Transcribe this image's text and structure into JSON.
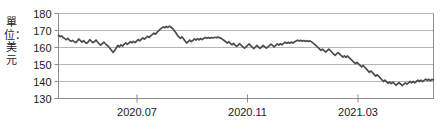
{
  "chart_data": {
    "type": "line",
    "title": "",
    "subtitle": "",
    "xlabel": "",
    "ylabel": "單位：美元",
    "ylabel_note": "Unit: US dollars",
    "ylim": [
      130,
      180
    ],
    "yticks": [
      130,
      140,
      150,
      160,
      170,
      180
    ],
    "ytick_labels": [
      "130",
      "140",
      "150",
      "160",
      "170",
      "180"
    ],
    "xticks": [
      "2020.07",
      "2020.11",
      "2021.03"
    ],
    "xtick_labels": [
      "2020.07",
      "2020.11",
      "2021.03"
    ],
    "grid": true,
    "legend": "none",
    "series": [
      {
        "name": "price",
        "color": "#4d4d4d",
        "values": [
          167.2,
          166.4,
          166.8,
          165.9,
          165.2,
          164.6,
          165.4,
          164.3,
          163.6,
          164.2,
          163.4,
          162.9,
          163.8,
          165.0,
          164.1,
          163.2,
          164.0,
          163.1,
          162.4,
          163.3,
          164.6,
          163.7,
          162.8,
          163.5,
          164.4,
          163.2,
          162.1,
          161.4,
          162.3,
          163.1,
          162.2,
          161.3,
          160.6,
          159.4,
          158.2,
          157.1,
          158.4,
          159.8,
          161.2,
          160.4,
          161.6,
          160.8,
          161.9,
          162.8,
          161.8,
          162.6,
          163.5,
          162.7,
          163.6,
          162.9,
          163.8,
          164.7,
          163.9,
          164.8,
          165.6,
          164.9,
          165.8,
          166.6,
          165.9,
          166.8,
          167.6,
          168.4,
          167.8,
          168.9,
          169.8,
          170.6,
          171.4,
          172.1,
          171.6,
          172.4,
          171.8,
          172.6,
          171.9,
          171.2,
          170.1,
          168.8,
          167.4,
          166.2,
          165.4,
          166.3,
          165.1,
          163.8,
          162.6,
          163.5,
          164.4,
          163.4,
          164.2,
          165.1,
          164.3,
          165.2,
          164.5,
          165.3,
          164.6,
          165.4,
          165.9,
          165.4,
          165.8,
          165.5,
          165.9,
          165.6,
          166.0,
          165.7,
          166.1,
          165.8,
          165.4,
          164.8,
          164.1,
          163.4,
          162.6,
          163.4,
          162.4,
          161.6,
          162.4,
          161.4,
          160.6,
          161.4,
          162.2,
          161.2,
          160.4,
          159.6,
          160.4,
          161.3,
          162.1,
          161.1,
          160.2,
          159.4,
          160.3,
          161.2,
          160.3,
          159.5,
          160.4,
          161.2,
          160.4,
          159.6,
          160.4,
          161.1,
          162.0,
          161.2,
          160.4,
          161.2,
          162.1,
          161.4,
          162.2,
          161.6,
          162.4,
          163.1,
          162.4,
          163.1,
          162.5,
          163.2,
          162.6,
          163.3,
          163.8,
          164.3,
          163.8,
          164.2,
          163.7,
          164.1,
          163.6,
          164.0,
          163.5,
          163.9,
          163.3,
          162.6,
          161.8,
          160.9,
          160.1,
          159.2,
          158.3,
          159.1,
          158.2,
          157.3,
          158.1,
          159.0,
          158.1,
          157.2,
          156.3,
          155.4,
          156.2,
          157.0,
          156.1,
          155.2,
          154.3,
          155.1,
          154.2,
          155.0,
          154.1,
          153.2,
          152.3,
          151.4,
          150.5,
          151.3,
          150.4,
          149.5,
          148.6,
          149.4,
          148.4,
          147.4,
          146.4,
          145.4,
          146.2,
          145.2,
          144.2,
          143.2,
          144.0,
          143.0,
          142.0,
          141.0,
          140.0,
          140.8,
          139.8,
          138.9,
          139.7,
          138.8,
          139.6,
          138.7,
          137.8,
          138.6,
          139.4,
          138.5,
          137.6,
          138.4,
          139.2,
          138.4,
          139.2,
          140.0,
          139.2,
          140.0,
          139.2,
          140.0,
          140.8,
          140.0,
          140.8,
          139.9,
          140.7,
          141.4,
          140.6,
          141.3,
          140.5,
          141.2,
          141.0
        ]
      }
    ]
  },
  "axes": {
    "y_label_vertical": "單位：美元"
  }
}
